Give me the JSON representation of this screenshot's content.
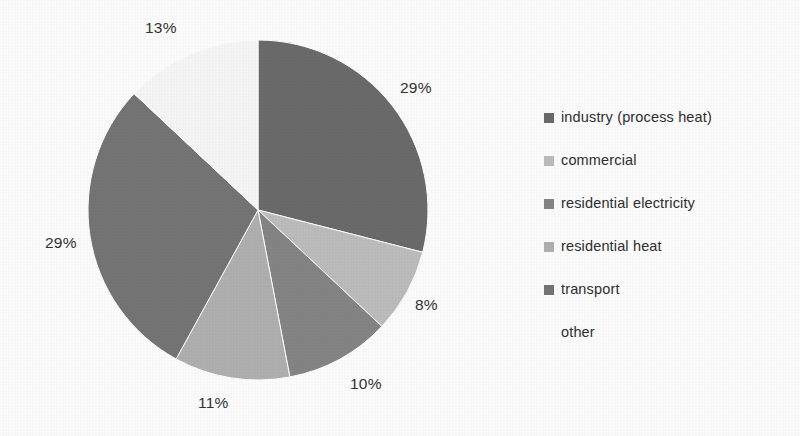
{
  "chart_data": {
    "type": "pie",
    "title": "",
    "subtitle": "",
    "xlabel": "",
    "ylabel": "",
    "legend_position": "right",
    "grid": false,
    "start_angle_deg": 0,
    "direction": "clockwise",
    "categories": [
      "industry (process heat)",
      "commercial",
      "residential electricity",
      "residential heat",
      "transport",
      "other"
    ],
    "values": [
      29,
      8,
      10,
      11,
      29,
      13
    ],
    "value_unit": "%",
    "labels": [
      "29%",
      "8%",
      "10%",
      "11%",
      "29%",
      "13%"
    ],
    "colors": [
      "#6b6b6b",
      "#bdbdbd",
      "#858585",
      "#b0b0b0",
      "#757575",
      "#f7f7f7"
    ]
  },
  "pie": {
    "center_x": 258,
    "center_y": 210,
    "radius": 170,
    "slices": [
      {
        "name": "industry (process heat)",
        "value": 29,
        "label": "29%",
        "color": "#6b6b6b",
        "label_x": 400,
        "label_y": 80
      },
      {
        "name": "commercial",
        "value": 8,
        "label": "8%",
        "color": "#bdbdbd",
        "label_x": 415,
        "label_y": 297
      },
      {
        "name": "residential electricity",
        "value": 10,
        "label": "10%",
        "color": "#858585",
        "label_x": 350,
        "label_y": 376
      },
      {
        "name": "residential heat",
        "value": 11,
        "label": "11%",
        "color": "#b0b0b0",
        "label_x": 198,
        "label_y": 395
      },
      {
        "name": "transport",
        "value": 29,
        "label": "29%",
        "color": "#757575",
        "label_x": 45,
        "label_y": 235
      },
      {
        "name": "other",
        "value": 13,
        "label": "13%",
        "color": "#f7f7f7",
        "label_x": 145,
        "label_y": 20
      }
    ]
  },
  "legend": {
    "items": [
      {
        "label": "industry (process heat)",
        "color": "#6b6b6b",
        "swatch_visible": true
      },
      {
        "label": "commercial",
        "color": "#bdbdbd",
        "swatch_visible": true
      },
      {
        "label": "residential electricity",
        "color": "#858585",
        "swatch_visible": true
      },
      {
        "label": "residential heat",
        "color": "#b0b0b0",
        "swatch_visible": true
      },
      {
        "label": "transport",
        "color": "#757575",
        "swatch_visible": true
      },
      {
        "label": "other",
        "color": "#ffffff",
        "swatch_visible": false
      }
    ]
  }
}
